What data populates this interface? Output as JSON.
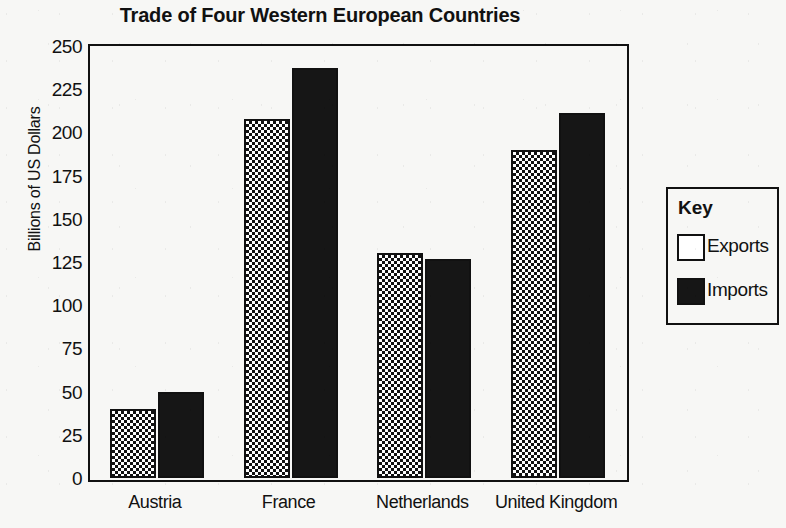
{
  "chart_data": {
    "type": "bar",
    "title": "Trade of Four Western European Countries",
    "xlabel": "",
    "ylabel": "Billions of US Dollars",
    "categories": [
      "Austria",
      "France",
      "Netherlands",
      "United Kingdom"
    ],
    "series": [
      {
        "name": "Exports",
        "values": [
          40,
          208,
          130,
          190
        ],
        "fill": "dotted",
        "color": "#ffffff"
      },
      {
        "name": "Imports",
        "values": [
          50,
          237,
          127,
          211
        ],
        "fill": "solid",
        "color": "#161616"
      }
    ],
    "ylim": [
      0,
      250
    ],
    "ytick_step": 25,
    "yticks": [
      250,
      225,
      200,
      175,
      150,
      125,
      100,
      75,
      50,
      25,
      0
    ],
    "grid": false,
    "legend": {
      "position": "right-outside",
      "title": "Key",
      "entries": [
        {
          "label": "Exports",
          "swatch": "white"
        },
        {
          "label": "Imports",
          "swatch": "black"
        }
      ]
    }
  },
  "colors": {
    "ink": "#111111",
    "paper": "#f7f7f5",
    "imports": "#161616",
    "exports": "#ffffff"
  }
}
